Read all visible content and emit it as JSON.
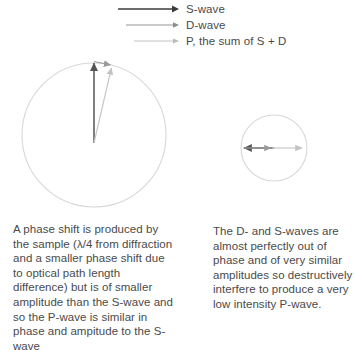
{
  "figure": {
    "name": "phase-contrast-wave-vector-diagram",
    "legend": {
      "items": [
        {
          "label": "S-wave",
          "color": "#3b3b3b",
          "icon": "arrow-right-icon"
        },
        {
          "label": "D-wave",
          "color": "#8d8d8d",
          "icon": "arrow-right-icon"
        },
        {
          "label": "P, the sum of S + D",
          "color": "#b9b9b9",
          "icon": "arrow-right-icon"
        }
      ]
    },
    "panels": [
      {
        "id": "left-panel",
        "circle": {
          "cx": 94,
          "cy": 135,
          "r": 72,
          "color": "#d6d6d6"
        },
        "vectors": [
          {
            "name": "s-wave-vector",
            "color": "#555555",
            "x1": 94,
            "y1": 143,
            "x2": 94,
            "y2": 62
          },
          {
            "name": "p-wave-vector",
            "color": "#c2c2c2",
            "x1": 94,
            "y1": 143,
            "x2": 112,
            "y2": 67
          },
          {
            "name": "d-wave-vector",
            "color": "#9a9a9a",
            "x1": 94,
            "y1": 62,
            "x2": 112,
            "y2": 66
          }
        ],
        "caption": "A phase shift is produced by the sample (λ/4 from diffraction and a smaller phase shift due to optical path length difference) but is of smaller amplitude than the S-wave and so the P-wave is similar in phase and ampitude to the S-wave"
      },
      {
        "id": "right-panel",
        "circle": {
          "cx": 274,
          "cy": 148,
          "r": 33,
          "color": "#d6d6d6"
        },
        "vectors": [
          {
            "name": "s-wave-vector",
            "color": "#555555",
            "x1": 274,
            "y1": 148,
            "x2": 243,
            "y2": 148
          },
          {
            "name": "d-wave-vector",
            "color": "#9a9a9a",
            "x1": 243,
            "y1": 148,
            "x2": 272,
            "y2": 148
          },
          {
            "name": "p-wave-vector",
            "color": "#c2c2c2",
            "x1": 272,
            "y1": 148,
            "x2": 303,
            "y2": 148
          }
        ],
        "caption": "The D- and S-waves are almost perfectly out of phase and of very similar amplitudes so destructively interfere to produce a very low intensity P-wave."
      }
    ]
  }
}
